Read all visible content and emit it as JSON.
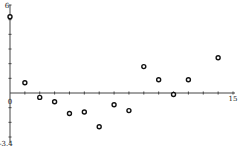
{
  "chart_data": {
    "type": "scatter",
    "title": "",
    "xlabel": "",
    "ylabel": "",
    "xlim": [
      0,
      15
    ],
    "ylim": [
      -3.4,
      6
    ],
    "tick_labels": {
      "x_origin": "0",
      "x_max": "15",
      "y_max": "6",
      "y_min": "-3.4"
    },
    "grid": false,
    "legend": null,
    "series": [
      {
        "name": "points",
        "marker": "hollow-circle",
        "color": "#111111",
        "x": [
          0,
          1,
          2,
          3,
          4,
          5,
          6,
          7,
          8,
          9,
          10,
          11,
          12,
          14
        ],
        "y": [
          5.2,
          0.7,
          -0.3,
          -0.6,
          -1.4,
          -1.3,
          -2.3,
          -0.8,
          -1.2,
          1.8,
          0.9,
          -0.1,
          0.9,
          2.4
        ]
      }
    ]
  },
  "colors": {
    "axis": "#444444",
    "marker": "#111111",
    "background": "#ffffff"
  }
}
